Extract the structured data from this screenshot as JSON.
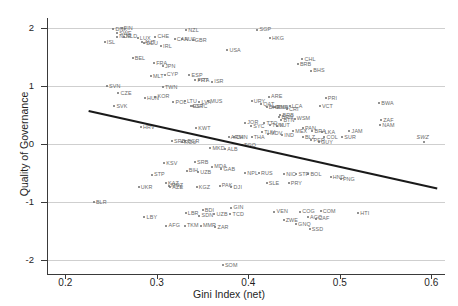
{
  "chart_data": {
    "type": "scatter",
    "title": "",
    "xlabel": "Gini Index (net)",
    "ylabel": "Quality of Governance",
    "xlim": [
      0.18,
      0.615
    ],
    "ylim": [
      -2.25,
      2.18
    ],
    "xticks": [
      "0.2",
      "0.3",
      "0.4",
      "0.5",
      "0.6"
    ],
    "xtick_values": [
      0.2,
      0.3,
      0.4,
      0.5,
      0.6
    ],
    "yticks": [
      "2",
      "1",
      "0",
      "-1",
      "-2"
    ],
    "ytick_values": [
      2,
      1,
      0,
      -1,
      -2
    ],
    "grid": "horizontal",
    "legend": "none",
    "point_color": "#6e6e6e",
    "label_color": "#6a6a6a",
    "fit_line": {
      "type": "linear",
      "color": "#1a1a1a",
      "width": 2.2,
      "x_start": 0.2255,
      "y_start": 0.57,
      "x_end": 0.6065,
      "y_end": -0.77
    },
    "points": [
      {
        "code": "DNK",
        "x": 0.2525,
        "y": 1.99
      },
      {
        "code": "FIN",
        "x": 0.2615,
        "y": 2.0
      },
      {
        "code": "SWE",
        "x": 0.2565,
        "y": 1.92
      },
      {
        "code": "NOR",
        "x": 0.2565,
        "y": 1.86
      },
      {
        "code": "NLD",
        "x": 0.264,
        "y": 1.86
      },
      {
        "code": "LUX",
        "x": 0.279,
        "y": 1.83
      },
      {
        "code": "ISL",
        "x": 0.243,
        "y": 1.77
      },
      {
        "code": "CHE",
        "x": 0.2985,
        "y": 1.86
      },
      {
        "code": "NZL",
        "x": 0.332,
        "y": 1.97
      },
      {
        "code": "AUT",
        "x": 0.284,
        "y": 1.76
      },
      {
        "code": "DEU",
        "x": 0.286,
        "y": 1.74
      },
      {
        "code": "CAN",
        "x": 0.3195,
        "y": 1.82
      },
      {
        "code": "AUS",
        "x": 0.3275,
        "y": 1.81
      },
      {
        "code": "GBR",
        "x": 0.339,
        "y": 1.8
      },
      {
        "code": "IRL",
        "x": 0.3045,
        "y": 1.69
      },
      {
        "code": "USA",
        "x": 0.377,
        "y": 1.62
      },
      {
        "code": "SGP",
        "x": 0.41,
        "y": 1.98
      },
      {
        "code": "HKG",
        "x": 0.4235,
        "y": 1.83
      },
      {
        "code": "BEL",
        "x": 0.2735,
        "y": 1.49
      },
      {
        "code": "FRA",
        "x": 0.297,
        "y": 1.4
      },
      {
        "code": "JPN",
        "x": 0.3065,
        "y": 1.35
      },
      {
        "code": "MLT",
        "x": 0.2935,
        "y": 1.17
      },
      {
        "code": "CYP",
        "x": 0.3085,
        "y": 1.2
      },
      {
        "code": "ESP",
        "x": 0.3355,
        "y": 1.19
      },
      {
        "code": "SVN",
        "x": 0.2455,
        "y": 1.0
      },
      {
        "code": "PRT",
        "x": 0.342,
        "y": 1.1
      },
      {
        "code": "ITA",
        "x": 0.346,
        "y": 1.1
      },
      {
        "code": "CZE",
        "x": 0.258,
        "y": 0.88
      },
      {
        "code": "ISR",
        "x": 0.3605,
        "y": 1.08
      },
      {
        "code": "TWN",
        "x": 0.3065,
        "y": 0.99
      },
      {
        "code": "CHL",
        "x": 0.459,
        "y": 1.47
      },
      {
        "code": "BRB",
        "x": 0.454,
        "y": 1.38
      },
      {
        "code": "BHS",
        "x": 0.4685,
        "y": 1.27
      },
      {
        "code": "HUN",
        "x": 0.287,
        "y": 0.79
      },
      {
        "code": "KOR",
        "x": 0.2985,
        "y": 0.82
      },
      {
        "code": "SVK",
        "x": 0.2535,
        "y": 0.66
      },
      {
        "code": "POL",
        "x": 0.318,
        "y": 0.72
      },
      {
        "code": "LTU",
        "x": 0.3305,
        "y": 0.74
      },
      {
        "code": "LVA",
        "x": 0.3465,
        "y": 0.73
      },
      {
        "code": "MUS",
        "x": 0.356,
        "y": 0.74
      },
      {
        "code": "EST",
        "x": 0.337,
        "y": 0.66
      },
      {
        "code": "HRV",
        "x": 0.2825,
        "y": 0.29
      },
      {
        "code": "GRC",
        "x": 0.3395,
        "y": 0.65
      },
      {
        "code": "URY",
        "x": 0.4035,
        "y": 0.74
      },
      {
        "code": "ARE",
        "x": 0.4225,
        "y": 0.82
      },
      {
        "code": "QAT",
        "x": 0.414,
        "y": 0.69
      },
      {
        "code": "BHR",
        "x": 0.42,
        "y": 0.64
      },
      {
        "code": "OMN",
        "x": 0.4275,
        "y": 0.64
      },
      {
        "code": "KNA",
        "x": 0.429,
        "y": 0.64
      },
      {
        "code": "LCA",
        "x": 0.445,
        "y": 0.66
      },
      {
        "code": "CRI",
        "x": 0.442,
        "y": 0.61
      },
      {
        "code": "PRI",
        "x": 0.4845,
        "y": 0.79
      },
      {
        "code": "VCT",
        "x": 0.478,
        "y": 0.66
      },
      {
        "code": "BWA",
        "x": 0.543,
        "y": 0.71
      },
      {
        "code": "ZAF",
        "x": 0.545,
        "y": 0.42
      },
      {
        "code": "NAM",
        "x": 0.544,
        "y": 0.33
      },
      {
        "code": "KWT",
        "x": 0.343,
        "y": 0.27
      },
      {
        "code": "JOR",
        "x": 0.3965,
        "y": 0.37
      },
      {
        "code": "SYC",
        "x": 0.403,
        "y": 0.31
      },
      {
        "code": "TTO",
        "x": 0.4175,
        "y": 0.36
      },
      {
        "code": "BRN",
        "x": 0.434,
        "y": 0.46
      },
      {
        "code": "BRB2",
        "x": 0.435,
        "y": 0.5
      },
      {
        "code": "BTN",
        "x": 0.436,
        "y": 0.42
      },
      {
        "code": "WSM",
        "x": 0.4505,
        "y": 0.44
      },
      {
        "code": "TUN",
        "x": 0.4235,
        "y": 0.33
      },
      {
        "code": "VUT",
        "x": 0.431,
        "y": 0.32
      },
      {
        "code": "BGR",
        "x": 0.331,
        "y": 0.05
      },
      {
        "code": "ROU",
        "x": 0.3275,
        "y": 0.03
      },
      {
        "code": "SRB",
        "x": 0.3165,
        "y": 0.05
      },
      {
        "code": "TUV",
        "x": 0.415,
        "y": 0.21
      },
      {
        "code": "MDV",
        "x": 0.4215,
        "y": 0.18
      },
      {
        "code": "MEX",
        "x": 0.449,
        "y": 0.22
      },
      {
        "code": "PAN",
        "x": 0.4595,
        "y": 0.27
      },
      {
        "code": "BRA",
        "x": 0.47,
        "y": 0.23
      },
      {
        "code": "LKA",
        "x": 0.481,
        "y": 0.2
      },
      {
        "code": "JAM",
        "x": 0.5105,
        "y": 0.22
      },
      {
        "code": "SUR",
        "x": 0.5025,
        "y": 0.12
      },
      {
        "code": "SWZ",
        "x": 0.5915,
        "y": 0.04
      },
      {
        "code": "MKD",
        "x": 0.3585,
        "y": -0.07
      },
      {
        "code": "TGO",
        "x": 0.393,
        "y": -0.02
      },
      {
        "code": "ALB",
        "x": 0.3745,
        "y": -0.09
      },
      {
        "code": "CHN",
        "x": 0.384,
        "y": 0.12
      },
      {
        "code": "ARM",
        "x": 0.3785,
        "y": 0.12
      },
      {
        "code": "THA",
        "x": 0.4035,
        "y": 0.12
      },
      {
        "code": "IND",
        "x": 0.437,
        "y": 0.15
      },
      {
        "code": "BLZ",
        "x": 0.4595,
        "y": 0.12
      },
      {
        "code": "COL",
        "x": 0.483,
        "y": 0.12
      },
      {
        "code": "GUY",
        "x": 0.477,
        "y": 0.03
      },
      {
        "code": "PER",
        "x": 0.469,
        "y": 0.07
      },
      {
        "code": "KSV",
        "x": 0.308,
        "y": -0.33
      },
      {
        "code": "SRB2",
        "x": 0.3415,
        "y": -0.31
      },
      {
        "code": "MDA",
        "x": 0.3605,
        "y": -0.39
      },
      {
        "code": "BIH",
        "x": 0.3325,
        "y": -0.46
      },
      {
        "code": "GAB",
        "x": 0.3705,
        "y": -0.44
      },
      {
        "code": "UZB",
        "x": 0.345,
        "y": -0.48
      },
      {
        "code": "NPL",
        "x": 0.3965,
        "y": -0.5
      },
      {
        "code": "RUS",
        "x": 0.4115,
        "y": -0.5
      },
      {
        "code": "NIC",
        "x": 0.439,
        "y": -0.52
      },
      {
        "code": "STP2",
        "x": 0.4525,
        "y": -0.52
      },
      {
        "code": "BOL",
        "x": 0.4655,
        "y": -0.52
      },
      {
        "code": "HND",
        "x": 0.49,
        "y": -0.57
      },
      {
        "code": "PNG",
        "x": 0.501,
        "y": -0.6
      },
      {
        "code": "STP",
        "x": 0.2945,
        "y": -0.53
      },
      {
        "code": "KAZ",
        "x": 0.31,
        "y": -0.68
      },
      {
        "code": "AZE",
        "x": 0.3145,
        "y": -0.74
      },
      {
        "code": "MOZ",
        "x": 0.313,
        "y": -0.72
      },
      {
        "code": "UKR",
        "x": 0.28,
        "y": -0.74
      },
      {
        "code": "KGZ",
        "x": 0.3435,
        "y": -0.74
      },
      {
        "code": "PAK",
        "x": 0.3685,
        "y": -0.72
      },
      {
        "code": "DJI",
        "x": 0.3815,
        "y": -0.75
      },
      {
        "code": "SLE",
        "x": 0.42,
        "y": -0.67
      },
      {
        "code": "PRY",
        "x": 0.444,
        "y": -0.68
      },
      {
        "code": "BLR",
        "x": 0.231,
        "y": -1.0
      },
      {
        "code": "GIN",
        "x": 0.3815,
        "y": -1.1
      },
      {
        "code": "BDI",
        "x": 0.35,
        "y": -1.14
      },
      {
        "code": "LBR",
        "x": 0.3315,
        "y": -1.2
      },
      {
        "code": "SDN",
        "x": 0.3465,
        "y": -1.24
      },
      {
        "code": "UZB2",
        "x": 0.363,
        "y": -1.21
      },
      {
        "code": "TCD",
        "x": 0.3805,
        "y": -1.21
      },
      {
        "code": "VEN",
        "x": 0.4285,
        "y": -1.17
      },
      {
        "code": "COG",
        "x": 0.4565,
        "y": -1.17
      },
      {
        "code": "COM",
        "x": 0.479,
        "y": -1.16
      },
      {
        "code": "HTI",
        "x": 0.52,
        "y": -1.2
      },
      {
        "code": "AGO",
        "x": 0.465,
        "y": -1.27
      },
      {
        "code": "CAF",
        "x": 0.474,
        "y": -1.29
      },
      {
        "code": "LBY",
        "x": 0.2865,
        "y": -1.26
      },
      {
        "code": "AFG",
        "x": 0.3105,
        "y": -1.41
      },
      {
        "code": "TKM",
        "x": 0.3305,
        "y": -1.41
      },
      {
        "code": "MMR",
        "x": 0.348,
        "y": -1.41
      },
      {
        "code": "ZAR",
        "x": 0.364,
        "y": -1.44
      },
      {
        "code": "ZWE",
        "x": 0.4385,
        "y": -1.32
      },
      {
        "code": "GNQ",
        "x": 0.452,
        "y": -1.39
      },
      {
        "code": "SSD",
        "x": 0.467,
        "y": -1.47
      },
      {
        "code": "SOM",
        "x": 0.372,
        "y": -2.09
      }
    ]
  }
}
